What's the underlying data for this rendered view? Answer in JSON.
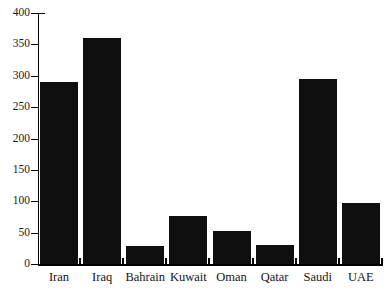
{
  "chart_data": {
    "type": "bar",
    "title": "",
    "xlabel": "",
    "ylabel": "",
    "categories": [
      "Iran",
      "Iraq",
      "Bahrain",
      "Kuwait",
      "Oman",
      "Qatar",
      "Saudi",
      "UAE"
    ],
    "values": [
      290,
      360,
      28,
      77,
      53,
      30,
      295,
      97
    ],
    "ylim": [
      0,
      400
    ],
    "yticks": [
      0,
      50,
      100,
      150,
      200,
      250,
      300,
      350,
      400
    ],
    "ytick_labels": [
      "0",
      "50",
      "100",
      "150",
      "200",
      "250",
      "300",
      "350",
      "400"
    ],
    "grid": false,
    "legend": false,
    "series": [
      {
        "name": "",
        "values": [
          290,
          360,
          28,
          77,
          53,
          30,
          295,
          97
        ]
      }
    ],
    "bar_color": "#100f0f",
    "background_color": "#ffffff",
    "axis_color": "#000000"
  },
  "chart": {
    "title_fragment": ""
  }
}
